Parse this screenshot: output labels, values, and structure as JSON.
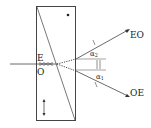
{
  "diagram": {
    "type": "wollaston-prism",
    "labels": {
      "e": "E",
      "o": "O",
      "eo": "EO",
      "oe": "OE",
      "alpha2": "α",
      "alpha2_sub": "2",
      "alpha1": "α",
      "alpha1_sub": "1"
    },
    "colors": {
      "line": "#333333",
      "background": "#ffffff"
    }
  }
}
